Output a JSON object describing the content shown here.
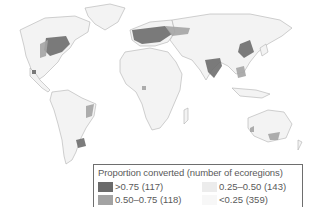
{
  "map": {
    "colors": {
      "background": "#ffffff",
      "land_low": "#f4f4f4",
      "land_mid_low": "#ececec",
      "land_mid_high": "#a3a3a3",
      "land_high": "#6b6b6b",
      "borders": "#b5b5b5"
    },
    "legend": {
      "title": "Proportion converted (number of ecoregions)",
      "items": [
        {
          "label": ">0.75 (117)",
          "color": "#6b6b6b"
        },
        {
          "label": "0.25–0.50 (143)",
          "color": "#ececec"
        },
        {
          "label": "0.50–0.75 (118)",
          "color": "#a3a3a3"
        },
        {
          "label": "<0.25 (359)",
          "color": "#f7f7f7"
        }
      ]
    }
  }
}
